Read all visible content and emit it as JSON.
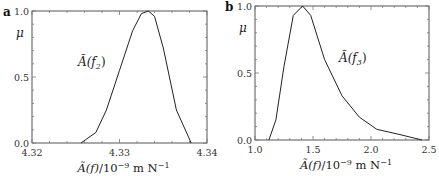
{
  "chart_data": [
    {
      "type": "line",
      "panel_label": "a",
      "title": "",
      "annotation": "Ã(f₂)",
      "xlabel": "Ã(f)/10⁻⁹ m N⁻¹",
      "ylabel": "μ",
      "xlim": [
        4.32,
        4.34
      ],
      "ylim": [
        0.0,
        1.0
      ],
      "xticks": [
        "4.32",
        "4.33",
        "4.34"
      ],
      "yticks": [
        "0.0",
        "0.5",
        "1.0"
      ],
      "grid": false,
      "series": [
        {
          "name": "Ã(f₂)",
          "x": [
            4.3256,
            4.3273,
            4.3285,
            4.33,
            4.3315,
            4.3325,
            4.3333,
            4.334,
            4.335,
            4.3365,
            4.3382
          ],
          "y": [
            0.0,
            0.08,
            0.25,
            0.55,
            0.85,
            0.98,
            1.0,
            0.96,
            0.72,
            0.25,
            0.0
          ]
        }
      ]
    },
    {
      "type": "line",
      "panel_label": "b",
      "title": "",
      "annotation": "Ã(f₃)",
      "xlabel": "Ã(f)/10⁻⁹ m N⁻¹",
      "ylabel": "μ",
      "xlim": [
        1.0,
        2.5
      ],
      "ylim": [
        0.0,
        1.0
      ],
      "xticks": [
        "1.0",
        "1.5",
        "2.0",
        "2.5"
      ],
      "yticks": [
        "0.0",
        "0.5",
        "1.0"
      ],
      "grid": false,
      "series": [
        {
          "name": "Ã(f₃)",
          "x": [
            1.12,
            1.18,
            1.25,
            1.33,
            1.41,
            1.48,
            1.6,
            1.75,
            1.9,
            2.05,
            2.25,
            2.44
          ],
          "y": [
            0.0,
            0.15,
            0.55,
            0.93,
            1.0,
            0.93,
            0.6,
            0.33,
            0.17,
            0.08,
            0.04,
            0.0
          ]
        }
      ]
    }
  ]
}
